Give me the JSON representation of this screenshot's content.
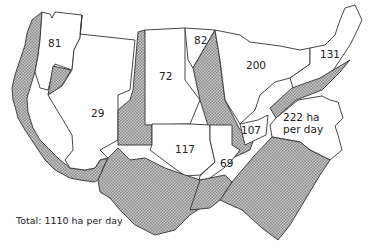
{
  "map": {
    "unit": "ha per day",
    "hatch_color": "#9a9a9a",
    "fill_color": "#ffffff",
    "stroke_color": "#333333",
    "regions": [
      {
        "id": "pacific-northwest",
        "label": "81"
      },
      {
        "id": "west",
        "label": "29"
      },
      {
        "id": "northern-plains",
        "label": "72"
      },
      {
        "id": "upper-midwest",
        "label": "82"
      },
      {
        "id": "great-lakes",
        "label": "200"
      },
      {
        "id": "northeast",
        "label": "131"
      },
      {
        "id": "mid-atlantic",
        "label_line1": "222 ha",
        "label_line2": "per day"
      },
      {
        "id": "appalachia",
        "label": "107"
      },
      {
        "id": "southern-plains",
        "label": "117"
      },
      {
        "id": "delta",
        "label": "69"
      }
    ],
    "total_label": "Total: 1110 ha per day"
  }
}
